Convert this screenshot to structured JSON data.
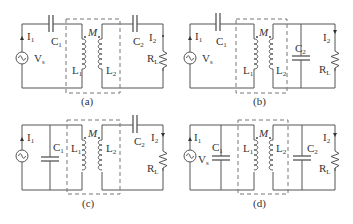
{
  "figure": {
    "panels": [
      {
        "id": "a",
        "caption": "(a)",
        "topology": "series C1 primary, series C2 secondary",
        "labels": {
          "I1": "I",
          "I1_sub": "1",
          "Vs": "V",
          "Vs_sub": "s",
          "C1": "C",
          "C1_sub": "1",
          "M": "M",
          "L1": "L",
          "L1_sub": "1",
          "L2": "L",
          "L2_sub": "2",
          "C2": "C",
          "C2_sub": "2",
          "I2": "I",
          "I2_sub": "2",
          "RL": "R",
          "RL_sub": "L"
        }
      },
      {
        "id": "b",
        "caption": "(b)",
        "topology": "series C1 primary, parallel C2 secondary",
        "labels": {
          "I1": "I",
          "I1_sub": "1",
          "Vs": "V",
          "Vs_sub": "s",
          "C1": "C",
          "C1_sub": "1",
          "M": "M",
          "L1": "L",
          "L1_sub": "1",
          "L2": "L",
          "L2_sub": "2",
          "C2": "C",
          "C2_sub": "2",
          "I2": "I",
          "I2_sub": "2",
          "RL": "R",
          "RL_sub": "L"
        }
      },
      {
        "id": "c",
        "caption": "(c)",
        "topology": "parallel C1 primary, series C2 secondary",
        "labels": {
          "I1": "I",
          "I1_sub": "1",
          "C1": "C",
          "C1_sub": "1",
          "M": "M",
          "L1": "L",
          "L1_sub": "1",
          "L2": "L",
          "L2_sub": "2",
          "C2": "C",
          "C2_sub": "2",
          "I2": "I",
          "I2_sub": "2",
          "RL": "R",
          "RL_sub": "L"
        }
      },
      {
        "id": "d",
        "caption": "(d)",
        "topology": "parallel C1 primary, parallel C2 secondary",
        "labels": {
          "I1": "I",
          "I1_sub": "1",
          "Vs": "V",
          "Vs_sub": "s",
          "C1": "C",
          "C1_sub": "1",
          "M": "M",
          "L1": "L",
          "L1_sub": "1",
          "L2": "L",
          "L2_sub": "2",
          "C2": "C",
          "C2_sub": "2",
          "I2": "I",
          "I2_sub": "2",
          "RL": "R",
          "RL_sub": "L"
        }
      }
    ]
  }
}
